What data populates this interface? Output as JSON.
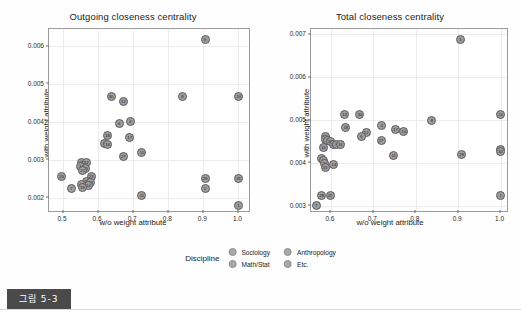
{
  "figure": {
    "caption": "그림 5-3"
  },
  "legend": {
    "title": "Discipline",
    "items": [
      {
        "label": "Sociology",
        "color": "#a8a8a8"
      },
      {
        "label": "Anthropology",
        "color": "#a8a8a8"
      },
      {
        "label": "Math/Stat",
        "color": "#a8a8a8"
      },
      {
        "label": "Etc.",
        "color": "#a8a8a8"
      }
    ]
  },
  "chart_data": [
    {
      "type": "scatter",
      "title": "Outgoing closeness centrality",
      "xlabel": "w/o weight attribute",
      "ylabel": "with weight attribute",
      "xlim": [
        0.46,
        1.03
      ],
      "ylim": [
        0.00165,
        0.00645
      ],
      "xticks": [
        0.5,
        0.6,
        0.7,
        0.8,
        0.9,
        1.0
      ],
      "xticklabels": [
        "0.5",
        "0.6",
        "0.7",
        "0.8",
        "0.9",
        "1.0"
      ],
      "yticks": [
        0.002,
        0.003,
        0.004,
        0.005,
        0.006
      ],
      "yticklabels": [
        "0.002",
        "0.003",
        "0.004",
        "0.005",
        "0.006"
      ],
      "grid": true,
      "legend_position": "bottom",
      "point_label_key": "id",
      "points": [
        {
          "id": "5",
          "x": 0.905,
          "y": 0.00617
        },
        {
          "id": "8",
          "x": 0.84,
          "y": 0.00466
        },
        {
          "id": "24",
          "x": 1.0,
          "y": 0.00466
        },
        {
          "id": "30",
          "x": 0.637,
          "y": 0.00468
        },
        {
          "id": "12",
          "x": 0.672,
          "y": 0.00455
        },
        {
          "id": "6",
          "x": 0.66,
          "y": 0.00395
        },
        {
          "id": "4",
          "x": 0.692,
          "y": 0.00401
        },
        {
          "id": "18",
          "x": 0.627,
          "y": 0.00365
        },
        {
          "id": "17",
          "x": 0.69,
          "y": 0.0036
        },
        {
          "id": "9",
          "x": 0.617,
          "y": 0.00344
        },
        {
          "id": "16",
          "x": 0.627,
          "y": 0.0034
        },
        {
          "id": "10",
          "x": 0.725,
          "y": 0.0032
        },
        {
          "id": "27",
          "x": 0.672,
          "y": 0.00309
        },
        {
          "id": "28",
          "x": 0.553,
          "y": 0.00292
        },
        {
          "id": "32",
          "x": 0.566,
          "y": 0.00292
        },
        {
          "id": "3",
          "x": 0.549,
          "y": 0.00282
        },
        {
          "id": "15",
          "x": 0.564,
          "y": 0.00278
        },
        {
          "id": "21",
          "x": 0.556,
          "y": 0.00271
        },
        {
          "id": "20",
          "x": 0.496,
          "y": 0.00257
        },
        {
          "id": "23",
          "x": 0.58,
          "y": 0.00255
        },
        {
          "id": "25",
          "x": 0.567,
          "y": 0.00243
        },
        {
          "id": "26",
          "x": 0.578,
          "y": 0.0024
        },
        {
          "id": "13",
          "x": 0.554,
          "y": 0.00235
        },
        {
          "id": "14",
          "x": 0.572,
          "y": 0.00231
        },
        {
          "id": "7",
          "x": 0.524,
          "y": 0.00225
        },
        {
          "id": "19",
          "x": 0.555,
          "y": 0.00228
        },
        {
          "id": "29",
          "x": 0.905,
          "y": 0.00252
        },
        {
          "id": "31",
          "x": 1.0,
          "y": 0.00252
        },
        {
          "id": "2",
          "x": 0.905,
          "y": 0.00225
        },
        {
          "id": "11",
          "x": 0.725,
          "y": 0.00207
        },
        {
          "id": "1",
          "x": 1.0,
          "y": 0.0018
        }
      ]
    },
    {
      "type": "scatter",
      "title": "Total closeness centrality",
      "xlabel": "w/o weight attribute",
      "ylabel": "with weight attribute",
      "xlim": [
        0.553,
        1.015
      ],
      "ylim": [
        0.00288,
        0.00712
      ],
      "xticks": [
        0.6,
        0.7,
        0.8,
        0.9,
        1.0
      ],
      "xticklabels": [
        "0.6",
        "0.7",
        "0.8",
        "0.9",
        "1.0"
      ],
      "yticks": [
        0.003,
        0.004,
        0.005,
        0.006,
        0.007
      ],
      "yticklabels": [
        "0.003",
        "0.004",
        "0.005",
        "0.006",
        "0.007"
      ],
      "grid": true,
      "legend_position": "bottom",
      "point_label_key": "id",
      "points": [
        {
          "id": "5",
          "x": 0.905,
          "y": 0.00688
        },
        {
          "id": "24",
          "x": 1.0,
          "y": 0.00512
        },
        {
          "id": "13",
          "x": 0.632,
          "y": 0.00513
        },
        {
          "id": "30",
          "x": 0.668,
          "y": 0.00513
        },
        {
          "id": "8",
          "x": 0.838,
          "y": 0.005
        },
        {
          "id": "18",
          "x": 0.635,
          "y": 0.00482
        },
        {
          "id": "4",
          "x": 0.72,
          "y": 0.00488
        },
        {
          "id": "17",
          "x": 0.752,
          "y": 0.00478
        },
        {
          "id": "10",
          "x": 0.772,
          "y": 0.00474
        },
        {
          "id": "12",
          "x": 0.683,
          "y": 0.0047
        },
        {
          "id": "6",
          "x": 0.672,
          "y": 0.00462
        },
        {
          "id": "21",
          "x": 0.587,
          "y": 0.00462
        },
        {
          "id": "3",
          "x": 0.588,
          "y": 0.00455
        },
        {
          "id": "23",
          "x": 0.593,
          "y": 0.00452
        },
        {
          "id": "30b",
          "x": 0.598,
          "y": 0.0045
        },
        {
          "id": "27",
          "x": 0.718,
          "y": 0.00452
        },
        {
          "id": "19",
          "x": 0.605,
          "y": 0.00442
        },
        {
          "id": "9",
          "x": 0.613,
          "y": 0.00442
        },
        {
          "id": "16",
          "x": 0.622,
          "y": 0.00442
        },
        {
          "id": "15",
          "x": 0.582,
          "y": 0.00435
        },
        {
          "id": "11",
          "x": 0.748,
          "y": 0.00418
        },
        {
          "id": "29",
          "x": 0.908,
          "y": 0.0042
        },
        {
          "id": "31",
          "x": 1.0,
          "y": 0.00432
        },
        {
          "id": "32",
          "x": 1.0,
          "y": 0.00426
        },
        {
          "id": "26",
          "x": 0.578,
          "y": 0.0041
        },
        {
          "id": "25",
          "x": 0.583,
          "y": 0.00405
        },
        {
          "id": "20",
          "x": 0.585,
          "y": 0.00398
        },
        {
          "id": "33",
          "x": 0.586,
          "y": 0.0039
        },
        {
          "id": "14",
          "x": 0.607,
          "y": 0.00397
        },
        {
          "id": "28",
          "x": 0.578,
          "y": 0.00325
        },
        {
          "id": "22",
          "x": 0.598,
          "y": 0.00323
        },
        {
          "id": "1",
          "x": 1.0,
          "y": 0.00325
        },
        {
          "id": "7",
          "x": 0.565,
          "y": 0.003
        }
      ]
    }
  ]
}
